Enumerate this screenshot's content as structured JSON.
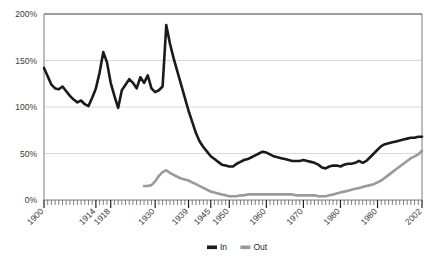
{
  "chart_data": {
    "type": "line",
    "title": "",
    "xlabel": "",
    "ylabel": "",
    "ylim": [
      0,
      200
    ],
    "xlim": [
      1900,
      2002
    ],
    "grid": true,
    "legend_position": "bottom-center",
    "y_ticks": [
      "0%",
      "50%",
      "100%",
      "150%",
      "200%"
    ],
    "y_tick_values": [
      0,
      50,
      100,
      150,
      200
    ],
    "x_ticks": [
      "1900",
      "1914",
      "1918",
      "1930",
      "1939",
      "1945",
      "1950",
      "1960",
      "1970",
      "1980",
      "1980",
      "2002"
    ],
    "x_tick_values": [
      1900,
      1914,
      1918,
      1930,
      1939,
      1945,
      1950,
      1960,
      1970,
      1980,
      1990,
      2002
    ],
    "x_minor_tick_step": 1,
    "series": [
      {
        "name": "In",
        "color": "#1a1a1a",
        "x": [
          1900,
          1901,
          1902,
          1903,
          1904,
          1905,
          1906,
          1907,
          1908,
          1909,
          1910,
          1911,
          1912,
          1913,
          1914,
          1915,
          1916,
          1917,
          1918,
          1919,
          1920,
          1921,
          1922,
          1923,
          1924,
          1925,
          1926,
          1927,
          1928,
          1929,
          1930,
          1931,
          1932,
          1933,
          1934,
          1935,
          1936,
          1937,
          1938,
          1939,
          1940,
          1941,
          1942,
          1943,
          1944,
          1945,
          1946,
          1947,
          1948,
          1949,
          1950,
          1951,
          1952,
          1953,
          1954,
          1955,
          1956,
          1957,
          1958,
          1959,
          1960,
          1961,
          1962,
          1963,
          1964,
          1965,
          1966,
          1967,
          1968,
          1969,
          1970,
          1971,
          1972,
          1973,
          1974,
          1975,
          1976,
          1977,
          1978,
          1979,
          1980,
          1981,
          1982,
          1983,
          1984,
          1985,
          1986,
          1987,
          1988,
          1989,
          1990,
          1991,
          1992,
          1993,
          1994,
          1995,
          1996,
          1997,
          1998,
          1999,
          2000,
          2001,
          2002
        ],
        "values": [
          142,
          133,
          124,
          120,
          119,
          122,
          117,
          112,
          108,
          105,
          107,
          103,
          101,
          110,
          120,
          137,
          159,
          148,
          126,
          112,
          99,
          118,
          124,
          130,
          126,
          120,
          132,
          126,
          134,
          120,
          116,
          118,
          122,
          188,
          168,
          152,
          138,
          124,
          110,
          96,
          84,
          72,
          63,
          57,
          52,
          47,
          44,
          41,
          38,
          37,
          36,
          36,
          39,
          41,
          43,
          44,
          46,
          48,
          50,
          52,
          51,
          49,
          47,
          46,
          45,
          44,
          43,
          42,
          42,
          42,
          43,
          42,
          41,
          40,
          38,
          35,
          34,
          36,
          37,
          37,
          36,
          38,
          39,
          39,
          40,
          42,
          40,
          42,
          46,
          50,
          54,
          58,
          60,
          61,
          62,
          63,
          64,
          65,
          66,
          67,
          67,
          68,
          68
        ]
      },
      {
        "name": "Out",
        "color": "#9a9a9a",
        "x": [
          1927,
          1928,
          1929,
          1930,
          1931,
          1932,
          1933,
          1934,
          1935,
          1936,
          1937,
          1938,
          1939,
          1940,
          1941,
          1942,
          1943,
          1944,
          1945,
          1946,
          1947,
          1948,
          1949,
          1950,
          1951,
          1952,
          1953,
          1954,
          1955,
          1956,
          1957,
          1958,
          1959,
          1960,
          1961,
          1962,
          1963,
          1964,
          1965,
          1966,
          1967,
          1968,
          1969,
          1970,
          1971,
          1972,
          1973,
          1974,
          1975,
          1976,
          1977,
          1978,
          1979,
          1980,
          1981,
          1982,
          1983,
          1984,
          1985,
          1986,
          1987,
          1988,
          1989,
          1990,
          1991,
          1992,
          1993,
          1994,
          1995,
          1996,
          1997,
          1998,
          1999,
          2000,
          2001,
          2002
        ],
        "values": [
          15,
          15,
          16,
          20,
          26,
          30,
          32,
          29,
          27,
          25,
          23,
          22,
          21,
          19,
          17,
          15,
          13,
          11,
          9,
          8,
          7,
          6,
          5,
          4,
          4,
          4,
          5,
          5,
          6,
          6,
          6,
          6,
          6,
          6,
          6,
          6,
          6,
          6,
          6,
          6,
          6,
          5,
          5,
          5,
          5,
          5,
          5,
          4,
          4,
          4,
          5,
          6,
          7,
          8,
          9,
          10,
          11,
          12,
          13,
          14,
          15,
          16,
          17,
          19,
          21,
          24,
          27,
          30,
          33,
          36,
          39,
          42,
          45,
          47,
          49,
          53
        ]
      }
    ]
  },
  "legend": {
    "items": [
      {
        "label": "In",
        "color": "#1a1a1a"
      },
      {
        "label": "Out",
        "color": "#9a9a9a"
      }
    ]
  }
}
